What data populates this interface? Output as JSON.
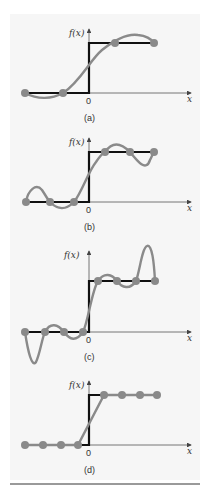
{
  "figure": {
    "colors": {
      "step": "#111111",
      "approx": "#8a8a8a",
      "dots": "#8a8a8a",
      "axis": "#555555",
      "panel_bg": "#f6f6f6",
      "rule": "#9a9a9a"
    },
    "axis_labels": {
      "y": "f(x)",
      "x": "x",
      "origin": "0"
    },
    "panels": [
      {
        "id": "a",
        "caption": "(a)",
        "nodes": 4,
        "description": "Step function approximated by cubic polynomial through 4 equally spaced points"
      },
      {
        "id": "b",
        "caption": "(b)",
        "nodes": 6,
        "description": "Step function approximated by 5th-order polynomial through 6 points, showing oscillation"
      },
      {
        "id": "c",
        "caption": "(c)",
        "nodes": 8,
        "description": "Step function approximated by 7th-order polynomial through 8 points, large oscillations at ends"
      },
      {
        "id": "d",
        "caption": "(d)",
        "nodes": 8,
        "description": "Step function approximated by linear splines through 8 points"
      }
    ]
  }
}
